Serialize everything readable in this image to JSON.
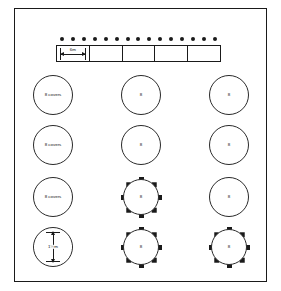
{
  "diagram": {
    "room": {
      "width_label": "walls 12m",
      "height_label": "walls 18m",
      "wall_color": "#1a1a1a"
    },
    "top_table": {
      "label": "top table of 15 covers",
      "segment_label": "6m",
      "segments": 5,
      "seat_count": 15,
      "seats": [
        1,
        2,
        3,
        4,
        5,
        6,
        7,
        8,
        9,
        10,
        11,
        12,
        13,
        14,
        15
      ]
    },
    "round_tables": {
      "diameter_label": "1½m",
      "rows": [
        {
          "row": 1,
          "cells": [
            {
              "label": "8 covers",
              "style": "plain"
            },
            {
              "label": "8",
              "style": "plain"
            },
            {
              "label": "8",
              "style": "plain"
            }
          ]
        },
        {
          "row": 2,
          "cells": [
            {
              "label": "8 covers",
              "style": "plain"
            },
            {
              "label": "8",
              "style": "plain"
            },
            {
              "label": "8",
              "style": "plain"
            }
          ]
        },
        {
          "row": 3,
          "cells": [
            {
              "label": "8 covers",
              "style": "plain"
            },
            {
              "label": "8",
              "style": "spoked-seated"
            },
            {
              "label": "8",
              "style": "plain"
            }
          ]
        },
        {
          "row": 4,
          "cells": [
            {
              "label": "1½m",
              "style": "diameter"
            },
            {
              "label": "8",
              "style": "seated"
            },
            {
              "label": "8",
              "style": "spoked-seated"
            }
          ]
        }
      ],
      "seats_per_table": 8
    }
  }
}
